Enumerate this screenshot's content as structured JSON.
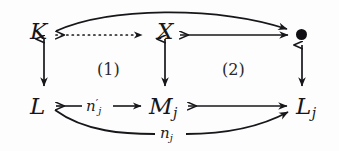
{
  "diagram": {
    "kind": "commutative-diagram",
    "background_color": "#fdfdfd",
    "ink_color": "#17161a",
    "nodes": [
      {
        "id": "K",
        "label": "K",
        "base": "K",
        "sub": "",
        "prime": false,
        "x": 30,
        "y": 22
      },
      {
        "id": "X",
        "label": "X",
        "base": "X",
        "sub": "",
        "prime": false,
        "x": 157,
        "y": 22
      },
      {
        "id": "T",
        "label": "•",
        "base": "•",
        "sub": "",
        "prime": false,
        "x": 296,
        "y": 28
      },
      {
        "id": "L",
        "label": "L",
        "base": "L",
        "sub": "",
        "prime": false,
        "x": 30,
        "y": 99
      },
      {
        "id": "Mj",
        "label": "Mj",
        "base": "M",
        "sub": "j",
        "prime": false,
        "x": 153,
        "y": 99
      },
      {
        "id": "Lj",
        "label": "Lj",
        "base": "L",
        "sub": "j",
        "prime": false,
        "x": 296,
        "y": 99
      }
    ],
    "edges": [
      {
        "id": "K-to-X",
        "from": "K",
        "to": "X",
        "style": "dotted",
        "head": "mono-arrow",
        "tail": "mono-tail",
        "label": ""
      },
      {
        "id": "X-to-dot",
        "from": "X",
        "to": "T",
        "style": "solid",
        "head": "mono-arrow",
        "tail": "mono-tail",
        "label": ""
      },
      {
        "id": "K-to-dot",
        "from": "K",
        "to": "T",
        "style": "curved-top",
        "head": "arrow",
        "tail": "mono-tail",
        "label": ""
      },
      {
        "id": "K-to-L",
        "from": "K",
        "to": "L",
        "style": "vertical",
        "head": "mono-arrow",
        "tail": "mono-tail",
        "label": ""
      },
      {
        "id": "X-to-Mj",
        "from": "X",
        "to": "Mj",
        "style": "vertical",
        "head": "mono-arrow",
        "tail": "mono-tail",
        "label": ""
      },
      {
        "id": "dot-to-Lj",
        "from": "T",
        "to": "Lj",
        "style": "vertical",
        "head": "mono-arrow",
        "tail": "mono-tail",
        "label": "n-prime-none"
      },
      {
        "id": "L-to-Mj",
        "from": "L",
        "to": "Mj",
        "style": "solid",
        "head": "arrow",
        "tail": "mono-tail",
        "label": "n'_j"
      },
      {
        "id": "Mj-to-Lj",
        "from": "Mj",
        "to": "Lj",
        "style": "solid",
        "head": "arrow",
        "tail": "mono-tail",
        "label": ""
      },
      {
        "id": "L-to-Lj",
        "from": "L",
        "to": "Lj",
        "style": "curved-bottom",
        "head": "arrow",
        "tail": "mono-tail",
        "label": "n_j"
      }
    ],
    "edge_labels": [
      {
        "id": "n-prime-j",
        "base": "n",
        "prime": "′",
        "sub": "j",
        "x": 93,
        "y": 100
      },
      {
        "id": "n-j",
        "base": "n",
        "prime": "",
        "sub": "j",
        "x": 163,
        "y": 128
      }
    ],
    "region_labels": [
      {
        "id": "region-1",
        "text": "(1)",
        "x": 97,
        "y": 62
      },
      {
        "id": "region-2",
        "text": "(2)",
        "x": 222,
        "y": 62
      }
    ]
  }
}
